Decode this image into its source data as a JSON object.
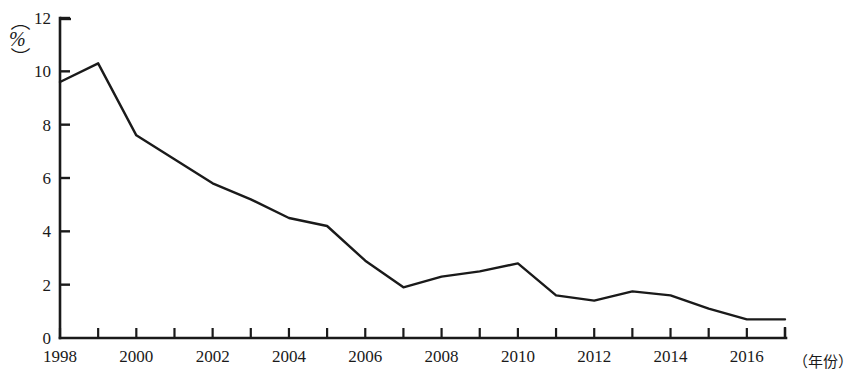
{
  "chart_data": {
    "type": "line",
    "title": "",
    "subtitle": "",
    "xlabel": "（年份）",
    "ylabel": "（%）",
    "unit_label": "%",
    "grid": false,
    "legend": null,
    "xlim": [
      1998,
      2017
    ],
    "ylim": [
      0,
      12
    ],
    "y_ticks": [
      0,
      2,
      4,
      6,
      8,
      10,
      12
    ],
    "y_tick_labels": [
      "0",
      "2",
      "4",
      "6",
      "8",
      "10",
      "12"
    ],
    "x_ticks": [
      1998,
      1999,
      2000,
      2001,
      2002,
      2003,
      2004,
      2005,
      2006,
      2007,
      2008,
      2009,
      2010,
      2011,
      2012,
      2013,
      2014,
      2015,
      2016,
      2017
    ],
    "x_tick_labels": [
      "1998",
      "",
      "2000",
      "",
      "2002",
      "",
      "2004",
      "",
      "2006",
      "",
      "2008",
      "",
      "2010",
      "",
      "2012",
      "",
      "2014",
      "",
      "2016",
      ""
    ],
    "x_labels_shown": [
      "1998",
      "2000",
      "2002",
      "2004",
      "2006",
      "2008",
      "2010",
      "2012",
      "2014",
      "2016"
    ],
    "x": [
      1998,
      1999,
      2000,
      2001,
      2002,
      2003,
      2004,
      2005,
      2006,
      2007,
      2008,
      2009,
      2010,
      2011,
      2012,
      2013,
      2014,
      2015,
      2016,
      2017
    ],
    "values": [
      9.6,
      10.3,
      7.6,
      6.7,
      5.8,
      5.2,
      4.5,
      4.2,
      2.9,
      1.9,
      2.3,
      2.5,
      2.8,
      1.6,
      1.4,
      1.75,
      1.6,
      1.1,
      0.7,
      0.7
    ],
    "series": [
      {
        "name": "",
        "color": "#1a1a1a",
        "values": [
          9.6,
          10.3,
          7.6,
          6.7,
          5.8,
          5.2,
          4.5,
          4.2,
          2.9,
          1.9,
          2.3,
          2.5,
          2.8,
          1.6,
          1.4,
          1.75,
          1.6,
          1.1,
          0.7,
          0.7
        ]
      }
    ],
    "line_color": "#1a1a1a",
    "line_width": 2.4,
    "markers": false,
    "annotations": []
  },
  "colors": {
    "axis": "#1a1a1a",
    "line": "#1a1a1a",
    "background": "#ffffff",
    "text": "#1a1a1a"
  },
  "geometry": {
    "plot_left": 60,
    "plot_right": 785,
    "plot_top": 18,
    "plot_bottom": 338
  }
}
